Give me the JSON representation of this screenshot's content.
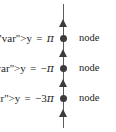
{
  "figure": {
    "type": "standing-wave-node-diagram",
    "background_color": "#ffffff",
    "mark_color": "#3c3c3c",
    "axis": {
      "orientation": "vertical",
      "color": "#5c5c5c",
      "top_y": 4,
      "bottom_y": 128,
      "x": 63
    },
    "arrows": [
      {
        "name": "arrow-1",
        "y": 23,
        "direction": "up"
      },
      {
        "name": "arrow-2",
        "y": 53,
        "direction": "up"
      },
      {
        "name": "arrow-3",
        "y": 83,
        "direction": "up"
      },
      {
        "name": "arrow-4",
        "y": 113,
        "direction": "up"
      }
    ],
    "rows": [
      {
        "dot_y": 38,
        "equation": {
          "variable": "y",
          "relation": "=",
          "sign": "",
          "coefficient": "",
          "symbol": "π",
          "text": "y = π"
        },
        "node_label": "node"
      },
      {
        "dot_y": 68,
        "equation": {
          "variable": "y",
          "relation": "=",
          "sign": "−",
          "coefficient": "",
          "symbol": "π",
          "text": "y = −π"
        },
        "node_label": "node"
      },
      {
        "dot_y": 98,
        "equation": {
          "variable": "y",
          "relation": "=",
          "sign": "−",
          "coefficient": "3",
          "symbol": "π",
          "text": "y = −3π"
        },
        "node_label": "node"
      }
    ]
  }
}
